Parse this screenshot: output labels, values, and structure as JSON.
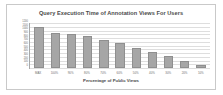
{
  "chart_data": {
    "type": "bar",
    "title": "Query Execution Time of Annotation Views For Users",
    "xlabel": "Percentage of Public Views",
    "ylabel": "Time (ms)",
    "categories": [
      "MAX",
      "100%",
      "90%",
      "80%",
      "70%",
      "60%",
      "50%",
      "40%",
      "30%",
      "20%",
      "10%"
    ],
    "values": [
      1100,
      930,
      920,
      850,
      740,
      660,
      540,
      420,
      310,
      180,
      90
    ],
    "ytick_labels": [
      "1200",
      "1100",
      "1000",
      "900",
      "800",
      "700",
      "600",
      "500",
      "400",
      "300",
      "200",
      "100",
      "0"
    ],
    "ylim": [
      0,
      1200
    ],
    "grid": true,
    "legend": "none",
    "bar_color": "#a6a6a6",
    "grid_color": "#dedede",
    "axis_color": "#a8a8a8"
  }
}
